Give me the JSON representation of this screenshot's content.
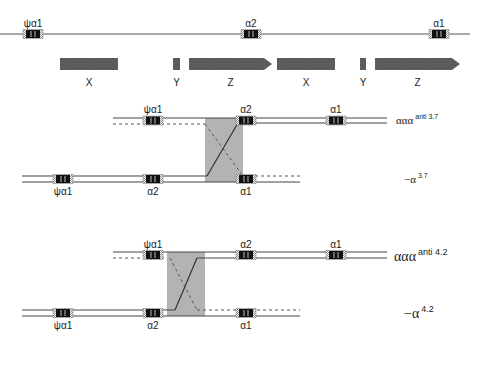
{
  "colors": {
    "line": "#444444",
    "gene_fill": "#111111",
    "gene_hatch": "#9a9a9a",
    "block": "#555555",
    "recomb_box": "#b3b3b3",
    "text": "#222222"
  },
  "top_map": {
    "genes": [
      {
        "label": "ψα1",
        "x": 23
      },
      {
        "label": "α2",
        "x": 241
      },
      {
        "label": "α1",
        "x": 429
      }
    ],
    "homology_blocks": [
      {
        "label": "X",
        "x": 60,
        "w": 58,
        "arrow": false
      },
      {
        "label": "Y",
        "x": 173,
        "w": 7,
        "arrow": false
      },
      {
        "label": "Z",
        "x": 189,
        "w": 83,
        "arrow": true
      },
      {
        "label": "X",
        "x": 277,
        "w": 58,
        "arrow": false
      },
      {
        "label": "Y",
        "x": 360,
        "w": 6,
        "arrow": false
      },
      {
        "label": "Z",
        "x": 375,
        "w": 85,
        "arrow": true
      }
    ]
  },
  "panel_3_7": {
    "upper": {
      "genes": [
        {
          "label": "ψα1",
          "x": 143
        },
        {
          "label": "α2",
          "x": 236
        },
        {
          "label": "α1",
          "x": 326
        }
      ],
      "label_main": "ααα",
      "label_sup": "anti 3.7"
    },
    "lower": {
      "genes": [
        {
          "label": "ψα1",
          "x": 53
        },
        {
          "label": "α2",
          "x": 143
        },
        {
          "label": "α1",
          "x": 236
        }
      ],
      "label_main": "−α",
      "label_sup": "3.7"
    }
  },
  "panel_4_2": {
    "upper": {
      "genes": [
        {
          "label": "ψα1",
          "x": 143
        },
        {
          "label": "α2",
          "x": 236
        },
        {
          "label": "α1",
          "x": 326
        }
      ],
      "label_main": "ααα",
      "label_sup": "anti 4.2"
    },
    "lower": {
      "genes": [
        {
          "label": "ψα1",
          "x": 53
        },
        {
          "label": "α2",
          "x": 143
        },
        {
          "label": "α1",
          "x": 236
        }
      ],
      "label_main": "−α",
      "label_sup": "4.2"
    }
  },
  "legend": {
    "gene_symbol_x": 148
  }
}
